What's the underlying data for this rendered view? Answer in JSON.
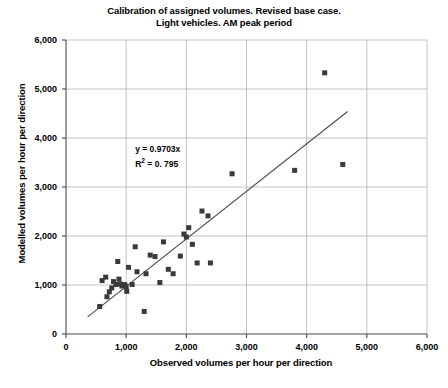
{
  "chart_data": {
    "type": "scatter",
    "title": "Calibration of assigned volumes. Revised base case.",
    "title_line2": "Light vehicles. AM peak period",
    "xlabel": "Observed  volumes per hour per direction",
    "ylabel": "Modelled volumes per hour per direction",
    "xlim": [
      0,
      6000
    ],
    "ylim": [
      0,
      6000
    ],
    "xticks": [
      0,
      1000,
      2000,
      3000,
      4000,
      5000,
      6000
    ],
    "yticks": [
      0,
      1000,
      2000,
      3000,
      4000,
      5000,
      6000
    ],
    "xtick_labels": [
      "0",
      "1,000",
      "2,000",
      "3,000",
      "4,000",
      "5,000",
      "6,000"
    ],
    "ytick_labels": [
      "0",
      "1,000",
      "2,000",
      "3,000",
      "4,000",
      "5,000",
      "6,000"
    ],
    "grid": true,
    "legend": "none",
    "marker_color": "#3a3a3a",
    "marker_shape": "square",
    "marker_size": 5,
    "trendline": {
      "equation": "y = 0.9703x",
      "r2_label": "R",
      "r2_sup": "2",
      "r2_value": "= 0. 795",
      "slope": 0.9703,
      "intercept": 0,
      "x_start": 360,
      "x_end": 4680,
      "color": "#4a4a4a"
    },
    "annotation": {
      "line1": "y = 0.9703x",
      "line2_prefix": "R",
      "line2_sup": "2",
      "line2_suffix": "= 0. 795"
    },
    "points": [
      {
        "x": 560,
        "y": 560
      },
      {
        "x": 600,
        "y": 1090
      },
      {
        "x": 660,
        "y": 1160
      },
      {
        "x": 680,
        "y": 760
      },
      {
        "x": 720,
        "y": 860
      },
      {
        "x": 760,
        "y": 940
      },
      {
        "x": 790,
        "y": 1070
      },
      {
        "x": 830,
        "y": 1010
      },
      {
        "x": 860,
        "y": 1480
      },
      {
        "x": 880,
        "y": 1120
      },
      {
        "x": 900,
        "y": 1020
      },
      {
        "x": 930,
        "y": 980
      },
      {
        "x": 960,
        "y": 1010
      },
      {
        "x": 980,
        "y": 1000
      },
      {
        "x": 1000,
        "y": 960
      },
      {
        "x": 1010,
        "y": 870
      },
      {
        "x": 1040,
        "y": 1360
      },
      {
        "x": 1100,
        "y": 1010
      },
      {
        "x": 1150,
        "y": 1780
      },
      {
        "x": 1180,
        "y": 1270
      },
      {
        "x": 1300,
        "y": 460
      },
      {
        "x": 1330,
        "y": 1230
      },
      {
        "x": 1400,
        "y": 1610
      },
      {
        "x": 1480,
        "y": 1580
      },
      {
        "x": 1560,
        "y": 1050
      },
      {
        "x": 1620,
        "y": 1880
      },
      {
        "x": 1700,
        "y": 1320
      },
      {
        "x": 1780,
        "y": 1230
      },
      {
        "x": 1900,
        "y": 1590
      },
      {
        "x": 1960,
        "y": 2040
      },
      {
        "x": 2000,
        "y": 1980
      },
      {
        "x": 2040,
        "y": 2170
      },
      {
        "x": 2100,
        "y": 1830
      },
      {
        "x": 2180,
        "y": 1450
      },
      {
        "x": 2260,
        "y": 2510
      },
      {
        "x": 2360,
        "y": 2410
      },
      {
        "x": 2400,
        "y": 1450
      },
      {
        "x": 2760,
        "y": 3270
      },
      {
        "x": 3800,
        "y": 3340
      },
      {
        "x": 4300,
        "y": 5330
      },
      {
        "x": 4600,
        "y": 3460
      }
    ]
  }
}
